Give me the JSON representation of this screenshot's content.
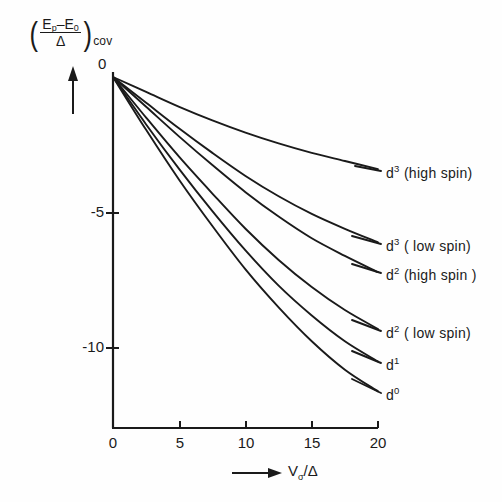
{
  "chart_data": {
    "type": "line",
    "title": "",
    "subtitle": "",
    "xlabel": "V_sigma/Delta",
    "ylabel": "((E_p - E_0)/Delta)_cov",
    "xlim": [
      0,
      20
    ],
    "ylim": [
      -12.5,
      0
    ],
    "xticks": [
      0,
      5,
      10,
      15,
      20
    ],
    "xticklabels": [
      "0",
      "5",
      "10",
      "15",
      "20"
    ],
    "yticks": [
      0,
      -5,
      -10
    ],
    "yticklabels": [
      "0",
      "-5",
      "-10"
    ],
    "grid": false,
    "legend_position": "right-inline-annotations",
    "x": [
      0,
      2.5,
      5,
      7.5,
      10,
      12.5,
      15,
      17.5,
      20
    ],
    "series": [
      {
        "name": "d3 (high spin)",
        "label_html": "d<sup>3</sup> (high spin)",
        "values": [
          0,
          -0.55,
          -1.1,
          -1.6,
          -2.05,
          -2.45,
          -2.8,
          -3.1,
          -3.4
        ]
      },
      {
        "name": "d3 (low spin)",
        "label_html": "d<sup>3</sup> ( low spin)",
        "values": [
          0,
          -0.95,
          -1.9,
          -2.8,
          -3.65,
          -4.4,
          -5.05,
          -5.6,
          -6.1
        ]
      },
      {
        "name": "d2 (high spin)",
        "label_html": "d<sup>2</sup> (high spin )",
        "values": [
          0,
          -1.1,
          -2.2,
          -3.25,
          -4.25,
          -5.15,
          -5.95,
          -6.6,
          -7.2
        ]
      },
      {
        "name": "d2 (low spin)",
        "label_html": "d<sup>2</sup> ( low spin)",
        "values": [
          0,
          -1.5,
          -2.95,
          -4.3,
          -5.6,
          -6.75,
          -7.75,
          -8.6,
          -9.3
        ]
      },
      {
        "name": "d1",
        "label_html": "d<sup>1</sup>",
        "values": [
          0,
          -1.75,
          -3.4,
          -4.95,
          -6.4,
          -7.7,
          -8.8,
          -9.75,
          -10.5
        ]
      },
      {
        "name": "d0",
        "label_html": "d<sup>0</sup>",
        "values": [
          0,
          -1.95,
          -3.8,
          -5.5,
          -7.1,
          -8.5,
          -9.75,
          -10.8,
          -11.6
        ]
      }
    ]
  },
  "axis": {
    "zero_label": "0",
    "y_tick_minus5": "-5",
    "y_tick_minus10": "-10",
    "x_tick_0": "0",
    "x_tick_5": "5",
    "x_tick_10": "10",
    "x_tick_15": "15",
    "x_tick_20": "20"
  },
  "ylabel_parts": {
    "open_paren": "(",
    "numerator_E": "E",
    "numerator_p": "p",
    "numerator_minus": "–E",
    "numerator_zero": "0",
    "denominator": "Δ",
    "close_paren": ")",
    "subscript": "cov"
  },
  "xlabel_parts": {
    "arrow": "⟶",
    "v": "V",
    "sigma": "σ",
    "slash_delta": "/Δ"
  },
  "curve_labels": [
    "d³ (high spin)",
    "d³ ( low spin)",
    "d² (high spin )",
    "d² ( low spin)",
    "d¹",
    "d⁰"
  ],
  "colors": {
    "ink": "#1a1a1a",
    "background": "#fefefe"
  }
}
